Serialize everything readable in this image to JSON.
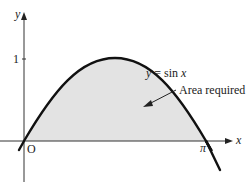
{
  "diagram": {
    "function_label": "y = sin x",
    "function_label_parts": {
      "y": "y",
      "eq": " = sin ",
      "x": "x"
    },
    "annotation": "Area required",
    "axes": {
      "x_label": "x",
      "y_label": "y",
      "origin_label": "O",
      "x_tick_label": "π",
      "y_tick_label": "1"
    },
    "colors": {
      "curve": "#111111",
      "shaded_region": "#e2e2e2",
      "axes": "#333333"
    }
  }
}
